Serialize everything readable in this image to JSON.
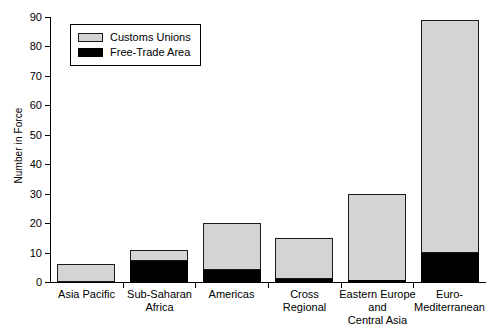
{
  "chart_data": {
    "type": "bar",
    "stacked": true,
    "title": "",
    "xlabel": "",
    "ylabel": "Number in Force",
    "ylim": [
      0,
      90
    ],
    "ytick_step": 10,
    "yticks": [
      "0",
      "10",
      "20",
      "30",
      "40",
      "50",
      "60",
      "70",
      "80",
      "90"
    ],
    "grid": false,
    "legend_position": "top-left",
    "categories": [
      "Asia Pacific",
      "Sub-Saharan Africa",
      "Americas",
      "Cross Regional",
      "Eastern Europe and Central Asia",
      "Euro-Mediterranean"
    ],
    "category_label_lines": [
      [
        "Asia Pacific"
      ],
      [
        "Sub-Saharan",
        "Africa"
      ],
      [
        "Americas"
      ],
      [
        "Cross",
        "Regional"
      ],
      [
        "Eastern Europe",
        "and",
        "Central Asia"
      ],
      [
        "Euro-",
        "Mediterranean"
      ]
    ],
    "series": [
      {
        "name": "Free-Trade Area",
        "color": "#000000",
        "values": [
          0,
          7,
          4,
          1,
          0.5,
          10
        ]
      },
      {
        "name": "Customs Unions",
        "color": "#d4d4d4",
        "values": [
          6,
          4,
          16,
          14,
          29.5,
          79
        ]
      }
    ],
    "totals": [
      6,
      11,
      20,
      15,
      30,
      89
    ]
  },
  "legend": {
    "entries": [
      {
        "label": "Customs Unions",
        "swatch": "customs-unions-swatch"
      },
      {
        "label": "Free-Trade Area",
        "swatch": "free-trade-area-swatch"
      }
    ]
  }
}
